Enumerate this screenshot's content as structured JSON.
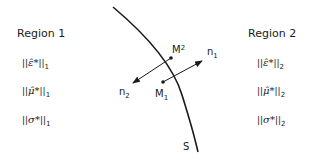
{
  "region1": {
    "title": "Region 1",
    "norms": [
      {
        "symbol": "ε̂*",
        "subscript": "1"
      },
      {
        "symbol": "μ̂*",
        "subscript": "1"
      },
      {
        "symbol": "σ*",
        "subscript": "1"
      }
    ]
  },
  "region2": {
    "title": "Region 2",
    "norms": [
      {
        "symbol": "ε̂*",
        "subscript": "2"
      },
      {
        "symbol": "μ̂*",
        "subscript": "2"
      },
      {
        "symbol": "σ*",
        "subscript": "2"
      }
    ]
  },
  "surface": {
    "label": "S"
  },
  "points": {
    "m1": {
      "label": "M",
      "subscript": "1"
    },
    "m2": {
      "label": "M",
      "subscript": "2"
    }
  },
  "normals": {
    "n1": {
      "label": "n",
      "subscript": "1"
    },
    "n2": {
      "label": "n",
      "subscript": "2"
    }
  },
  "bars": "||"
}
